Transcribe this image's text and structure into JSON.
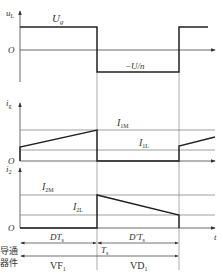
{
  "diagram": {
    "type": "waveform-timing",
    "panels": [
      {
        "id": "uL",
        "ylabel": "u",
        "ylabel_sub": "L",
        "origin": "O",
        "level_high": "U",
        "level_high_sub": "g",
        "level_low": "−U/n"
      },
      {
        "id": "ig",
        "ylabel": "i",
        "ylabel_sub": "g",
        "origin": "O",
        "max_label": "I",
        "max_sub": "1M",
        "min_label": "I",
        "min_sub": "1L"
      },
      {
        "id": "i2",
        "ylabel": "i",
        "ylabel_sub": "2",
        "origin": "O",
        "max_label": "I",
        "max_sub": "2M",
        "min_label": "I",
        "min_sub": "2L",
        "xlabel": "t"
      }
    ],
    "intervals": {
      "on_time": "DT",
      "on_time_sub": "s",
      "off_time": "D′T",
      "off_time_sub": "s",
      "period": "T",
      "period_sub": "s"
    },
    "conduction": {
      "row_label_line1": "导通",
      "row_label_line2": "器件",
      "device_on": "VF",
      "device_on_sub": "1",
      "device_off": "VD",
      "device_off_sub": "1"
    },
    "colors": {
      "trace": "#222222",
      "grid": "#777777"
    }
  }
}
